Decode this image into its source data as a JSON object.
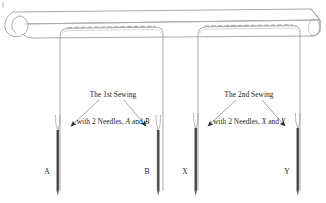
{
  "figure": {
    "background_color": "#ffffff",
    "line_color": "#8a8a8a",
    "needle_color": "#3b3b3b",
    "text_color": "#231f20",
    "width": 326,
    "height": 203
  },
  "fabric": {
    "name": "folded-fabric-tube",
    "hem_stitch_style": "dashed"
  },
  "annotations": [
    {
      "id": "first-sewing",
      "line1": "The 1st Sewing",
      "line2_prefix": "with 2 Needles, ",
      "needle_1": "A",
      "conjunction": " and ",
      "needle_2": "B"
    },
    {
      "id": "second-sewing",
      "line1": "The 2nd Sewing",
      "line2_prefix": "with 2 Needles, ",
      "needle_1": "X",
      "conjunction": " and ",
      "needle_2": "Y"
    }
  ],
  "needles": [
    {
      "id": "needle-a",
      "label": "A"
    },
    {
      "id": "needle-b",
      "label": "B"
    },
    {
      "id": "needle-x",
      "label": "X"
    },
    {
      "id": "needle-y",
      "label": "Y"
    }
  ]
}
